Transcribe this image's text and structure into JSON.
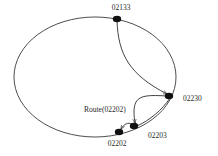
{
  "diagram": {
    "type": "chord-ring-routing",
    "nodes": [
      {
        "id": "02133",
        "label": "02133"
      },
      {
        "id": "02230",
        "label": "02230"
      },
      {
        "id": "02203",
        "label": "02203"
      },
      {
        "id": "02202",
        "label": "02202"
      }
    ],
    "edges": [
      {
        "from": "02133",
        "to": "02230",
        "kind": "route-hop"
      },
      {
        "from": "02230",
        "to": "02203",
        "kind": "route-hop"
      },
      {
        "from": "02203",
        "to": "02202",
        "kind": "route-hop"
      }
    ],
    "route_label": "Route(02202)",
    "colors": {
      "ring": "#3a3a3a",
      "node": "#111111",
      "text": "#2a2a2a",
      "background": "#ffffff"
    }
  }
}
